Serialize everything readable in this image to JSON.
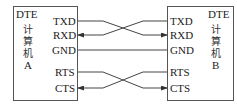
{
  "diagram": {
    "type": "serial-null-modem-wiring",
    "left_device": {
      "title": "DTE",
      "name_lines": [
        "计",
        "算",
        "机",
        "A"
      ],
      "pins": [
        "TXD",
        "RXD",
        "GND",
        "RTS",
        "CTS"
      ]
    },
    "right_device": {
      "title": "DTE",
      "name_lines": [
        "计",
        "算",
        "机",
        "B"
      ],
      "pins": [
        "TXD",
        "RXD",
        "GND",
        "RTS",
        "CTS"
      ]
    },
    "connections": [
      {
        "from": "A.TXD",
        "to": "B.RXD",
        "crossed": true,
        "arrow_at": "B"
      },
      {
        "from": "B.TXD",
        "to": "A.RXD",
        "crossed": true,
        "arrow_at": "A"
      },
      {
        "from": "A.GND",
        "to": "B.GND",
        "crossed": false
      },
      {
        "from": "A.RTS",
        "to": "B.CTS",
        "crossed": true,
        "arrow_at": "B"
      },
      {
        "from": "B.RTS",
        "to": "A.CTS",
        "crossed": true,
        "arrow_at": "A"
      }
    ],
    "colors": {
      "line": "#444444",
      "text": "#222222",
      "background": "#ffffff"
    }
  }
}
